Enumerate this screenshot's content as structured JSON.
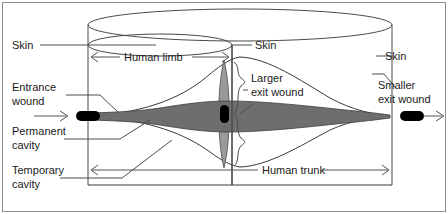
{
  "figure": {
    "type": "wound-ballistics-profile-diagram",
    "background_color": "#ffffff",
    "line_color": "#3a3a3a",
    "cavity_fill_color": "#6e6e6e",
    "lens_fill_color": "#9a9a9a",
    "bullet_color": "#000000"
  },
  "labels": {
    "skin_left": "Skin",
    "skin_center": "Skin",
    "skin_right": "Skin",
    "entrance_wound_line1": "Entrance",
    "entrance_wound_line2": "wound",
    "permanent_cavity_line1": "Permanent",
    "permanent_cavity_line2": "cavity",
    "temporary_cavity_line1": "Temporary",
    "temporary_cavity_line2": "cavity",
    "larger_exit_wound_line1": "Larger",
    "larger_exit_wound_line2": "exit wound",
    "smaller_exit_wound_line1": "Smaller",
    "smaller_exit_wound_line2": "exit wound",
    "human_limb": "Human limb",
    "human_trunk": "Human trunk"
  },
  "annotations": {
    "limb_span_label": "Human limb",
    "trunk_span_label": "Human trunk",
    "entrance_direction": "left-to-right",
    "exit_direction": "left-to-right"
  }
}
